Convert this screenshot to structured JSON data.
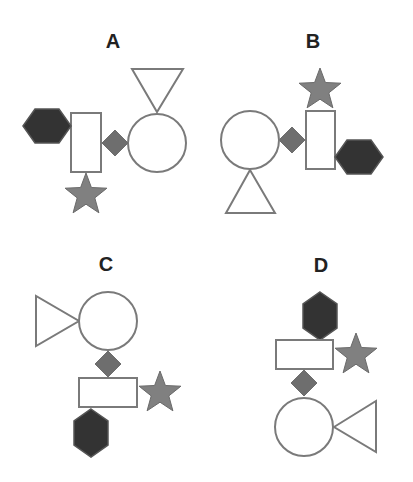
{
  "colors": {
    "outline": "#7a7a7a",
    "white_fill": "#ffffff",
    "dark_fill": "#333333",
    "mid_fill": "#6e6e6e",
    "star_fill": "#808080",
    "label": "#222222"
  },
  "options": [
    {
      "label": "A",
      "label_pos": [
        113,
        48
      ],
      "shapes": [
        {
          "type": "triangle",
          "role": "triangle-down",
          "points": "132,69 183,69 157,112"
        },
        {
          "type": "circle",
          "cx": 157,
          "cy": 143,
          "r": 29
        },
        {
          "type": "diamond",
          "cx": 115,
          "cy": 143,
          "h": 13
        },
        {
          "type": "rect",
          "x": 71,
          "y": 113,
          "w": 30,
          "h": 59
        },
        {
          "type": "hexagon",
          "cx": 47,
          "cy": 126,
          "orientation": "horizontal",
          "w": 48,
          "h": 34
        },
        {
          "type": "star",
          "cx": 86,
          "cy": 195,
          "r": 22
        }
      ]
    },
    {
      "label": "B",
      "label_pos": [
        313,
        48
      ],
      "shapes": [
        {
          "type": "star",
          "cx": 320,
          "cy": 90,
          "r": 22
        },
        {
          "type": "rect",
          "x": 306,
          "y": 111,
          "w": 29,
          "h": 58
        },
        {
          "type": "diamond",
          "cx": 292,
          "cy": 140,
          "h": 13
        },
        {
          "type": "circle",
          "cx": 250,
          "cy": 140,
          "r": 29
        },
        {
          "type": "triangle",
          "role": "triangle-up",
          "points": "250,170 226,213 275,213"
        },
        {
          "type": "hexagon",
          "cx": 359,
          "cy": 157,
          "orientation": "horizontal",
          "w": 48,
          "h": 34
        }
      ]
    },
    {
      "label": "C",
      "label_pos": [
        106,
        271
      ],
      "shapes": [
        {
          "type": "triangle",
          "role": "triangle-right",
          "points": "36,296 36,346 79,321"
        },
        {
          "type": "circle",
          "cx": 108,
          "cy": 321,
          "r": 29
        },
        {
          "type": "diamond",
          "cx": 108,
          "cy": 364,
          "h": 13
        },
        {
          "type": "rect",
          "x": 79,
          "y": 378,
          "w": 58,
          "h": 29
        },
        {
          "type": "star",
          "cx": 160,
          "cy": 393,
          "r": 22
        },
        {
          "type": "hexagon",
          "cx": 91,
          "cy": 433,
          "orientation": "vertical",
          "w": 34,
          "h": 48
        }
      ]
    },
    {
      "label": "D",
      "label_pos": [
        321,
        272
      ],
      "shapes": [
        {
          "type": "hexagon",
          "cx": 320,
          "cy": 316,
          "orientation": "vertical",
          "w": 34,
          "h": 48
        },
        {
          "type": "rect",
          "x": 276,
          "y": 340,
          "w": 57,
          "h": 29
        },
        {
          "type": "star",
          "cx": 356,
          "cy": 355,
          "r": 22
        },
        {
          "type": "diamond",
          "cx": 304,
          "cy": 383,
          "h": 13
        },
        {
          "type": "circle",
          "cx": 304,
          "cy": 427,
          "r": 29
        },
        {
          "type": "triangle",
          "role": "triangle-left",
          "points": "334,427 376,401 376,452"
        }
      ]
    }
  ]
}
